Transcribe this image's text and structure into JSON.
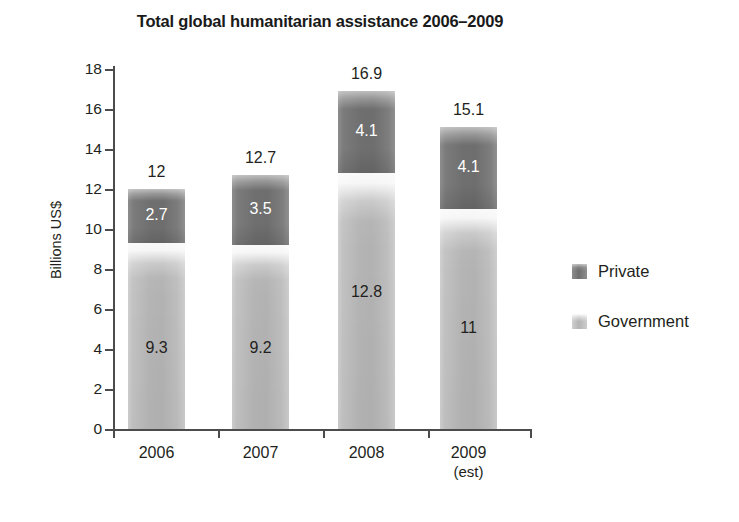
{
  "chart_data": {
    "type": "bar",
    "subtype": "stacked-vertical",
    "title": "Total global humanitarian assistance 2006–2009",
    "xlabel": "",
    "ylabel": "Billions US$",
    "ylim": [
      0,
      18
    ],
    "ytick_step": 2,
    "yticks": [
      "18",
      "16",
      "14",
      "12",
      "10",
      "8",
      "6",
      "4",
      "2",
      "0"
    ],
    "grid": false,
    "legend_position": "right",
    "categories": [
      "2006",
      "2007",
      "2008",
      "2009"
    ],
    "category_sublabels": [
      "",
      "",
      "",
      "(est)"
    ],
    "series": [
      {
        "name": "Government",
        "color": "#b4b4b4",
        "values": [
          9.3,
          9.2,
          12.8,
          11
        ],
        "labels": [
          "9.3",
          "9.2",
          "12.8",
          "11"
        ]
      },
      {
        "name": "Private",
        "color": "#6f6f6f",
        "values": [
          2.7,
          3.5,
          4.1,
          4.1
        ],
        "labels": [
          "2.7",
          "3.5",
          "4.1",
          "4.1"
        ]
      }
    ],
    "totals": [
      12,
      12.7,
      16.9,
      15.1
    ],
    "total_labels": [
      "12",
      "12.7",
      "16.9",
      "15.1"
    ]
  },
  "legend": {
    "items": [
      {
        "label": "Private",
        "swatch": "private-swatch-icon"
      },
      {
        "label": "Government",
        "swatch": "government-swatch-icon"
      }
    ]
  }
}
